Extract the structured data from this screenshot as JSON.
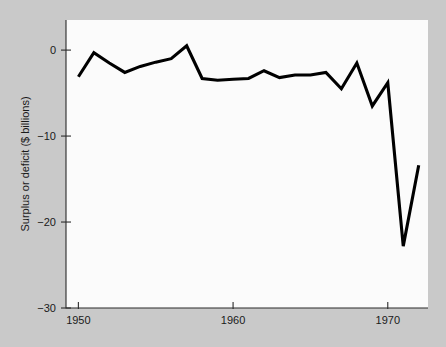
{
  "chart_data": {
    "type": "line",
    "title": "",
    "subtitle": "",
    "xlabel": "",
    "ylabel": "Surplus or deficit ($ billions)",
    "xlim": [
      1949.2,
      1972.6
    ],
    "ylim": [
      -30,
      3.5
    ],
    "grid": false,
    "legend": null,
    "x_ticks": [
      1950,
      1960,
      1970
    ],
    "x_tick_labels": [
      "1950",
      "1960",
      "1970"
    ],
    "y_ticks": [
      0,
      -10,
      -20,
      -30
    ],
    "y_tick_labels": [
      "0",
      "−10",
      "−20",
      "−30"
    ],
    "x": [
      1950,
      1951,
      1952,
      1953,
      1954,
      1955,
      1956,
      1957,
      1958,
      1959,
      1960,
      1961,
      1962,
      1963,
      1964,
      1965,
      1966,
      1967,
      1968,
      1969,
      1970,
      1971,
      1972
    ],
    "series": [
      {
        "name": "Surplus or deficit",
        "values": [
          -3.1,
          -0.3,
          -1.5,
          -2.6,
          -1.9,
          -1.4,
          -1.0,
          0.5,
          -3.3,
          -3.5,
          -3.4,
          -3.3,
          -2.4,
          -3.2,
          -2.9,
          -2.9,
          -2.6,
          -4.5,
          -1.5,
          -6.5,
          -3.8,
          -22.8,
          -13.4
        ]
      }
    ],
    "line_color": "#000000",
    "plot_background": "#fbfbfb",
    "figure_background": "#c9c9c9",
    "annotations": []
  },
  "geometry": {
    "plot_left": 66,
    "plot_right": 428,
    "plot_top": 20,
    "plot_bottom": 308,
    "axis_color": "#2b2b2b"
  }
}
